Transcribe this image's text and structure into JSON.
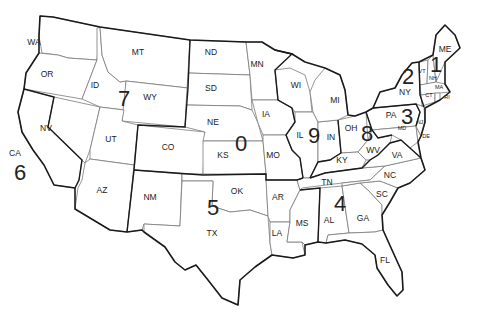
{
  "map": {
    "title": "US Amateur Radio Call Sign Districts",
    "background": "#ffffff",
    "line_color": "#1a1a1a",
    "states": [
      {
        "abbr": "WA",
        "x": 34,
        "y": 45
      },
      {
        "abbr": "OR",
        "x": 47,
        "y": 77
      },
      {
        "abbr": "CA",
        "x": 15,
        "y": 156
      },
      {
        "abbr": "NV",
        "x": 46,
        "y": 131
      },
      {
        "abbr": "ID",
        "x": 95,
        "y": 88
      },
      {
        "abbr": "MT",
        "x": 138,
        "y": 55
      },
      {
        "abbr": "WY",
        "x": 150,
        "y": 100
      },
      {
        "abbr": "UT",
        "x": 111,
        "y": 142
      },
      {
        "abbr": "CO",
        "x": 168,
        "y": 150
      },
      {
        "abbr": "AZ",
        "x": 102,
        "y": 193
      },
      {
        "abbr": "NM",
        "x": 150,
        "y": 200
      },
      {
        "abbr": "ND",
        "x": 211,
        "y": 55
      },
      {
        "abbr": "SD",
        "x": 211,
        "y": 91
      },
      {
        "abbr": "NE",
        "x": 213,
        "y": 125
      },
      {
        "abbr": "KS",
        "x": 223,
        "y": 158
      },
      {
        "abbr": "OK",
        "x": 237,
        "y": 194
      },
      {
        "abbr": "TX",
        "x": 212,
        "y": 236
      },
      {
        "abbr": "MN",
        "x": 257,
        "y": 67
      },
      {
        "abbr": "IA",
        "x": 266,
        "y": 117
      },
      {
        "abbr": "MO",
        "x": 273,
        "y": 158
      },
      {
        "abbr": "AR",
        "x": 278,
        "y": 200
      },
      {
        "abbr": "LA",
        "x": 277,
        "y": 236
      },
      {
        "abbr": "WI",
        "x": 296,
        "y": 88
      },
      {
        "abbr": "IL",
        "x": 300,
        "y": 138
      },
      {
        "abbr": "MI",
        "x": 335,
        "y": 103
      },
      {
        "abbr": "IN",
        "x": 331,
        "y": 140
      },
      {
        "abbr": "OH",
        "x": 351,
        "y": 131
      },
      {
        "abbr": "KY",
        "x": 342,
        "y": 163
      },
      {
        "abbr": "TN",
        "x": 327,
        "y": 185
      },
      {
        "abbr": "MS",
        "x": 302,
        "y": 226
      },
      {
        "abbr": "AL",
        "x": 329,
        "y": 223
      },
      {
        "abbr": "GA",
        "x": 363,
        "y": 221
      },
      {
        "abbr": "FL",
        "x": 385,
        "y": 263
      },
      {
        "abbr": "SC",
        "x": 382,
        "y": 197
      },
      {
        "abbr": "NC",
        "x": 390,
        "y": 178
      },
      {
        "abbr": "VA",
        "x": 397,
        "y": 158
      },
      {
        "abbr": "WV",
        "x": 373,
        "y": 153
      },
      {
        "abbr": "PA",
        "x": 391,
        "y": 118
      },
      {
        "abbr": "NY",
        "x": 405,
        "y": 95
      },
      {
        "abbr": "MD",
        "x": 402,
        "y": 130,
        "small": true
      },
      {
        "abbr": "DE",
        "x": 426,
        "y": 138,
        "small": true
      },
      {
        "abbr": "NJ",
        "x": 420,
        "y": 124,
        "small": true
      },
      {
        "abbr": "VT",
        "x": 422,
        "y": 73,
        "small": true
      },
      {
        "abbr": "NH",
        "x": 433,
        "y": 80,
        "small": true
      },
      {
        "abbr": "MA",
        "x": 439,
        "y": 89,
        "small": true
      },
      {
        "abbr": "CT",
        "x": 429,
        "y": 97,
        "small": true
      },
      {
        "abbr": "RI",
        "x": 447,
        "y": 99,
        "small": true
      },
      {
        "abbr": "ME",
        "x": 445,
        "y": 52
      }
    ],
    "districts": [
      {
        "number": "0",
        "x": 241,
        "y": 151
      },
      {
        "number": "1",
        "x": 436,
        "y": 72
      },
      {
        "number": "2",
        "x": 408,
        "y": 84
      },
      {
        "number": "3",
        "x": 407,
        "y": 124
      },
      {
        "number": "4",
        "x": 340,
        "y": 211
      },
      {
        "number": "5",
        "x": 213,
        "y": 215
      },
      {
        "number": "6",
        "x": 20,
        "y": 180
      },
      {
        "number": "7",
        "x": 124,
        "y": 106
      },
      {
        "number": "8",
        "x": 367,
        "y": 141
      },
      {
        "number": "9",
        "x": 314,
        "y": 143
      }
    ]
  }
}
